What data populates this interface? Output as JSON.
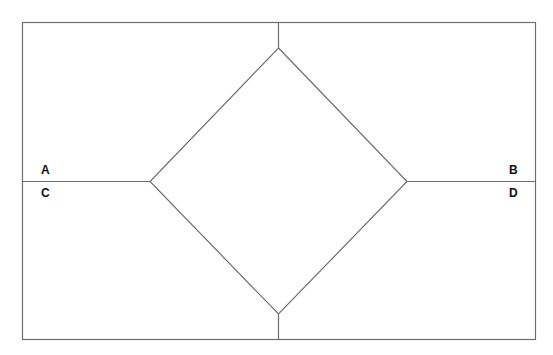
{
  "diagram": {
    "labels": {
      "a": "A",
      "b": "B",
      "c": "C",
      "d": "D"
    },
    "colors": {
      "line": "#6e6e6e",
      "background": "#ffffff",
      "text": "#111111"
    },
    "shapes": {
      "outer_rect": {
        "x": 22,
        "y": 22,
        "width": 513,
        "height": 317
      },
      "diamond": {
        "top": [
          278,
          48
        ],
        "left": [
          150,
          181
        ],
        "right": [
          407,
          181
        ],
        "bottom": [
          278,
          314
        ]
      }
    }
  }
}
